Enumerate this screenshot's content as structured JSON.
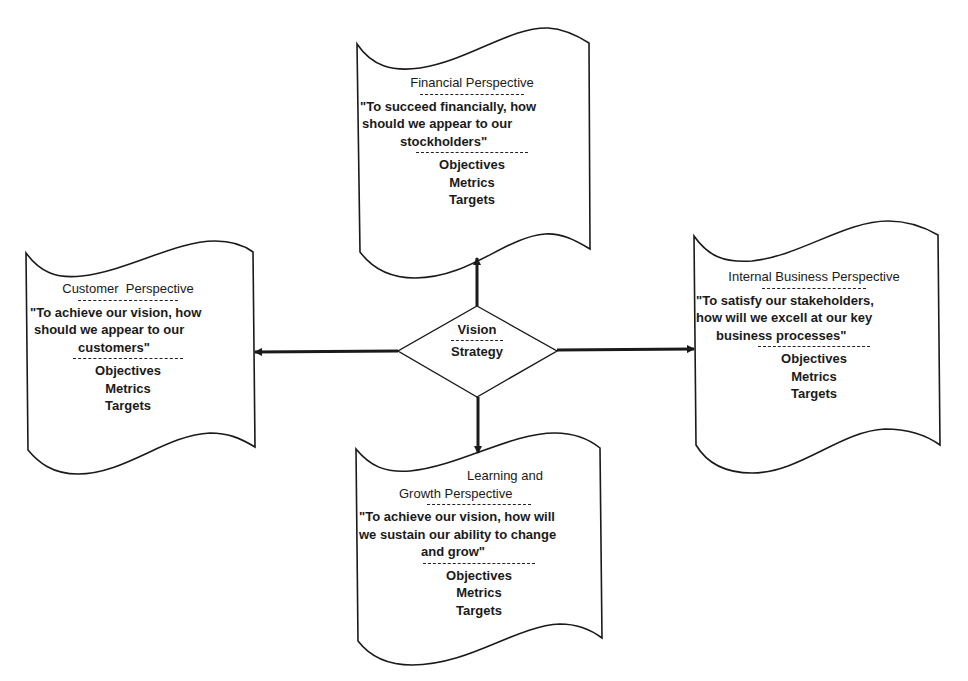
{
  "center": {
    "top_label": "Vision",
    "bottom_label": "Strategy"
  },
  "perspectives": {
    "financial": {
      "title": "Financial Perspective",
      "quote_lines": [
        "\"To succeed financially, how",
        "should we appear to our",
        "stockholders\""
      ],
      "items": [
        "Objectives",
        "Metrics",
        "Targets"
      ]
    },
    "customer": {
      "title": "Customer  Perspective",
      "quote_lines": [
        "\"To achieve our vision, how",
        "should we appear to our",
        "customers\""
      ],
      "items": [
        "Objectives",
        "Metrics",
        "Targets"
      ]
    },
    "internal": {
      "title": "Internal Business Perspective",
      "quote_lines": [
        "\"To satisfy our stakeholders,",
        "how will we excell at our key",
        "business processes\""
      ],
      "items": [
        "Objectives",
        "Metrics",
        "Targets"
      ]
    },
    "learning": {
      "title_lines": [
        "Learning and",
        "Growth Perspective"
      ],
      "quote_lines": [
        "\"To achieve our vision, how will",
        "we sustain our ability to change",
        "and grow\""
      ],
      "items": [
        "Objectives",
        "Metrics",
        "Targets"
      ]
    }
  },
  "colors": {
    "stroke": "#1a1a1a",
    "background": "#ffffff"
  }
}
